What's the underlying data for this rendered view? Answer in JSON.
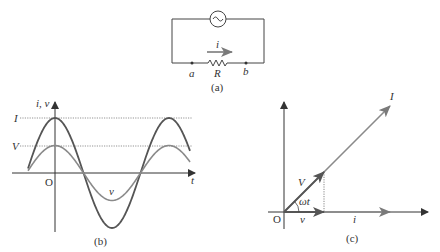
{
  "colors": {
    "dark": "#555555",
    "light": "#8a8a8a",
    "text": "#333333"
  },
  "panel_a": {
    "caption": "(a)",
    "current_label": "i",
    "node_a": "a",
    "node_b": "b",
    "resistor_label": "R",
    "source_icon": "ac-source-icon"
  },
  "panel_b": {
    "caption": "(b)",
    "y_axis_label": "i, v",
    "x_axis_label": "t",
    "origin_label": "O",
    "peak_current_label": "I",
    "peak_voltage_label": "V",
    "voltage_curve_label": "v",
    "curves": [
      {
        "name": "current",
        "amplitude_label": "I",
        "relative_amplitude": 1.0
      },
      {
        "name": "voltage",
        "amplitude_label": "V",
        "relative_amplitude": 0.5
      }
    ]
  },
  "panel_c": {
    "caption": "(c)",
    "origin_label": "O",
    "phasor_I_label": "I",
    "phasor_V_label": "V",
    "angle_label": "ωt",
    "projection_v_label": "v",
    "projection_i_label": "i"
  }
}
